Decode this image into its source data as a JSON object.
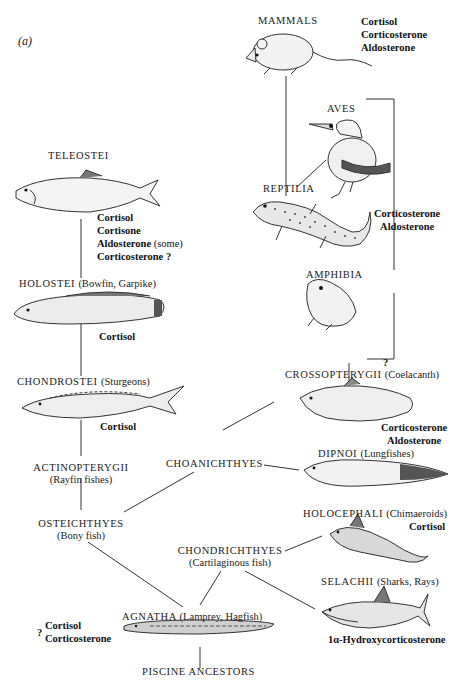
{
  "panel_label": "(a)",
  "groups": {
    "mammals": {
      "name": "MAMMALS",
      "hormones": [
        "Cortisol",
        "Corticosterone",
        "Aldosterone"
      ]
    },
    "aves": {
      "name": "AVES"
    },
    "reptilia": {
      "name": "REPTILIA"
    },
    "amphibia": {
      "name": "AMPHIBIA"
    },
    "tetrapod_bracket": {
      "hormones": [
        "Corticosterone",
        "Aldosterone"
      ]
    },
    "teleostei": {
      "name": "TELEOSTEI",
      "hormones": [
        "Cortisol",
        "Cortisone",
        "Aldosterone",
        "Corticosterone ?"
      ],
      "note": "(some)"
    },
    "holostei": {
      "name": "HOLOSTEI",
      "common": "(Bowfin, Garpike)",
      "hormones": [
        "Cortisol"
      ]
    },
    "chondrostei": {
      "name": "CHONDROSTEI",
      "common": "(Sturgeons)",
      "hormones": [
        "Cortisol"
      ]
    },
    "actinopterygii": {
      "name": "ACTINOPTERYGII",
      "common": "(Rayfin fishes)"
    },
    "osteichthyes": {
      "name": "OSTEICHTHYES",
      "common": "(Bony fish)"
    },
    "choanichthyes": {
      "name": "CHOANICHTHYES"
    },
    "crossopterygii": {
      "name": "CROSSOPTERYGII",
      "common": "(Coelacanth)",
      "question": "?",
      "hormones": [
        "Corticosterone",
        "Aldosterone"
      ]
    },
    "dipnoi": {
      "name": "DIPNOI",
      "common": "(Lungfishes)"
    },
    "holocephali": {
      "name": "HOLOCEPHALI",
      "common": "(Chimaeroids)",
      "hormones": [
        "Cortisol"
      ]
    },
    "chondrichthyes": {
      "name": "CHONDRICHTHYES",
      "common": "(Cartilaginous fish)"
    },
    "selachii": {
      "name": "SELACHII",
      "common": "(Sharks, Rays)",
      "hormones": [
        "1α-Hydroxycorticosterone"
      ]
    },
    "agnatha": {
      "name": "AGNATHA",
      "common": "(Lamprey, Hagfish)",
      "question": "?",
      "hormones": [
        "Cortisol",
        "Corticosterone"
      ]
    },
    "piscine_ancestors": {
      "name": "PISCINE ANCESTORS"
    }
  }
}
